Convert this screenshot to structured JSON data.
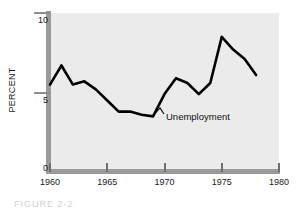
{
  "figure": {
    "caption": "FIGURE 2-2"
  },
  "chart_data": {
    "type": "line",
    "title": "",
    "xlabel": "",
    "ylabel": "PERCENT",
    "xlim": [
      1960,
      1980
    ],
    "ylim": [
      0,
      10
    ],
    "grid": false,
    "legend": "inline-annotation",
    "annotations": [
      {
        "text": "Unemployment",
        "x": 1970,
        "y": 3.6
      }
    ],
    "xticks": [
      1960,
      1965,
      1970,
      1975,
      1980
    ],
    "xticklabels": [
      "1960",
      "1965",
      "1970",
      "1975",
      "1980"
    ],
    "yticks": [
      0,
      5,
      10
    ],
    "yticklabels": [
      "0",
      "5",
      "10"
    ],
    "series": [
      {
        "name": "Unemployment",
        "color": "#000000",
        "x": [
          1960,
          1961,
          1962,
          1963,
          1964,
          1965,
          1966,
          1967,
          1968,
          1969,
          1970,
          1971,
          1972,
          1973,
          1974,
          1975,
          1976,
          1977,
          1978
        ],
        "values": [
          5.5,
          6.7,
          5.5,
          5.7,
          5.2,
          4.5,
          3.8,
          3.8,
          3.6,
          3.5,
          4.9,
          5.9,
          5.6,
          4.9,
          5.6,
          8.5,
          7.7,
          7.1,
          6.1
        ]
      }
    ]
  }
}
